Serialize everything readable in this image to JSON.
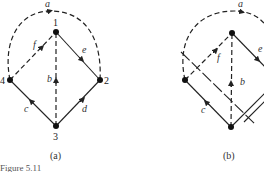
{
  "figure": {
    "caption_partial": "Figure 5.11",
    "panels": [
      {
        "id": "a",
        "label": "(a)",
        "nodes": [
          {
            "id": "1",
            "label": "1",
            "x": 56,
            "y": 32
          },
          {
            "id": "2",
            "label": "2",
            "x": 100,
            "y": 80
          },
          {
            "id": "3",
            "label": "3",
            "x": 56,
            "y": 126
          },
          {
            "id": "4",
            "label": "4",
            "x": 10,
            "y": 80
          }
        ],
        "edges": [
          {
            "id": "a",
            "label": "a",
            "from": "4",
            "to": "2",
            "style": "dashed",
            "shape": "arc"
          },
          {
            "id": "b",
            "label": "b",
            "from": "3",
            "to": "1",
            "style": "dashed"
          },
          {
            "id": "c",
            "label": "c",
            "from": "3",
            "to": "4",
            "style": "solid"
          },
          {
            "id": "d",
            "label": "d",
            "from": "3",
            "to": "2",
            "style": "solid"
          },
          {
            "id": "e",
            "label": "e",
            "from": "1",
            "to": "2",
            "style": "solid"
          },
          {
            "id": "f",
            "label": "f",
            "from": "4",
            "to": "1",
            "style": "dashed"
          }
        ]
      },
      {
        "id": "b",
        "label": "(b)",
        "edge_labels": {
          "a": "a",
          "b": "b",
          "c": "c",
          "e": "e",
          "f": "f"
        },
        "cut_lines": 2
      }
    ]
  },
  "colors": {
    "ink": "#222222",
    "background": "#ffffff"
  }
}
